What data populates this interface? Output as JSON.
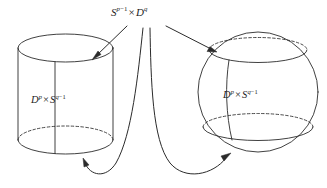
{
  "figure": {
    "kind": "mathematical-diagram",
    "background_color": "#ffffff",
    "stroke_color": "#2b2b2b"
  },
  "labels": {
    "top": {
      "name": "S^{p-1} x D^q",
      "base1": "S",
      "exp1_var": "p",
      "exp1_op": "−1",
      "times": "×",
      "base2": "D",
      "exp2": "q"
    },
    "left_body": {
      "name": "D^p x S^{q-1}",
      "base1": "D",
      "exp1": "p",
      "times": "×",
      "base2": "S",
      "exp2_var": "q",
      "exp2_op": "−1"
    },
    "right_body": {
      "name": "D^p x S^{q-1}",
      "base1": "D",
      "exp1": "p",
      "times": "×",
      "base2": "S",
      "exp2_var": "q",
      "exp2_op": "−1"
    }
  },
  "shapes": {
    "cylinder": {
      "name": "left-cylinder",
      "left_x": 18,
      "right_x": 113,
      "top_y": 48,
      "bottom_y": 140,
      "ellipse_ry": 14
    },
    "sphere": {
      "name": "right-sphere",
      "center_x": 258,
      "center_y": 92,
      "radius": 60
    }
  },
  "arrows": [
    {
      "name": "arrow-to-cylinder-top",
      "target": "cylinder top ellipse",
      "style": "straight"
    },
    {
      "name": "arrow-to-sphere-top",
      "target": "sphere top ellipse",
      "style": "straight"
    },
    {
      "name": "arrow-to-cylinder-bottom",
      "target": "cylinder bottom ellipse",
      "style": "curved"
    },
    {
      "name": "arrow-to-sphere-bottom",
      "target": "sphere bottom ellipse",
      "style": "curved"
    }
  ]
}
